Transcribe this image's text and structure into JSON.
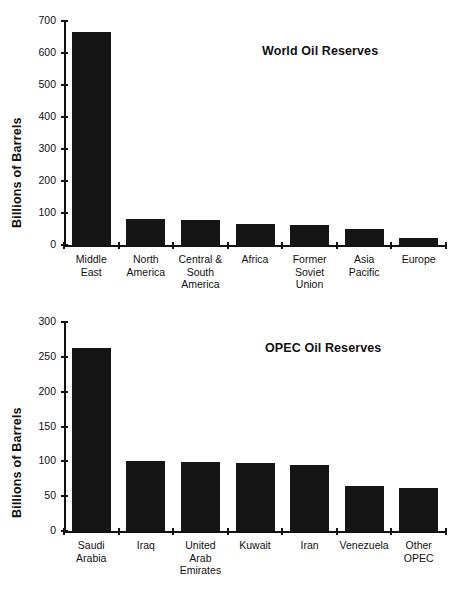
{
  "chart_data": [
    {
      "type": "bar",
      "id": "world-oil-reserves",
      "title": "World Oil Reserves",
      "xlabel": "",
      "ylabel": "Billions of Barrels",
      "ylim": [
        0,
        700
      ],
      "yticks": [
        0,
        100,
        200,
        300,
        400,
        500,
        600,
        700
      ],
      "ytick_labels": [
        "0",
        "100",
        "200",
        "300",
        "400",
        "500",
        "600",
        "700"
      ],
      "grid": false,
      "legend": "none",
      "bar_color": "#151515",
      "categories": [
        "Middle\nEast",
        "North\nAmerica",
        "Central &\nSouth\nAmerica",
        "Africa",
        "Former\nSoviet\nUnion",
        "Asia\nPacific",
        "Europe"
      ],
      "values": [
        665,
        82,
        77,
        65,
        61,
        49,
        21
      ]
    },
    {
      "type": "bar",
      "id": "opec-oil-reserves",
      "title": "OPEC Oil Reserves",
      "xlabel": "",
      "ylabel": "Billions of Barrels",
      "ylim": [
        0,
        300
      ],
      "yticks": [
        0,
        50,
        100,
        150,
        200,
        250,
        300
      ],
      "ytick_labels": [
        "0",
        "50",
        "100",
        "150",
        "200",
        "250",
        "300"
      ],
      "grid": false,
      "legend": "none",
      "bar_color": "#151515",
      "categories": [
        "Saudi\nArabia",
        "Iraq",
        "United\nArab\nEmirates",
        "Kuwait",
        "Iran",
        "Venezuela",
        "Other\nOPEC"
      ],
      "values": [
        262,
        101,
        99,
        98,
        95,
        64,
        62
      ]
    }
  ]
}
